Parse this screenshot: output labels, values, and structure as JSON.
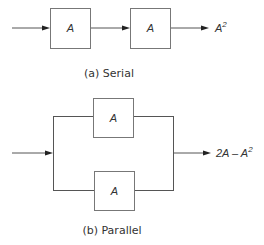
{
  "serial": {
    "caption": "(a) Serial",
    "blocks": [
      {
        "label": "A"
      },
      {
        "label": "A"
      }
    ],
    "output": {
      "base": "A",
      "exp": "2"
    }
  },
  "parallel": {
    "caption": "(b) Parallel",
    "blocks": [
      {
        "label": "A"
      },
      {
        "label": "A"
      }
    ],
    "output": {
      "prefix": "2A – A",
      "exp": "2"
    }
  },
  "colors": {
    "line": "#555555",
    "box_border": "#777777",
    "text": "#333333"
  }
}
